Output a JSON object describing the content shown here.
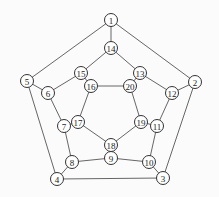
{
  "graph": {
    "nodes": [
      {
        "id": "1",
        "x": 111,
        "y": 20
      },
      {
        "id": "2",
        "x": 195,
        "y": 82
      },
      {
        "id": "3",
        "x": 163,
        "y": 178
      },
      {
        "id": "4",
        "x": 57,
        "y": 179
      },
      {
        "id": "5",
        "x": 27,
        "y": 81
      },
      {
        "id": "6",
        "x": 48,
        "y": 93
      },
      {
        "id": "7",
        "x": 64,
        "y": 126
      },
      {
        "id": "8",
        "x": 72,
        "y": 162
      },
      {
        "id": "9",
        "x": 111,
        "y": 158
      },
      {
        "id": "10",
        "x": 149,
        "y": 162
      },
      {
        "id": "11",
        "x": 157,
        "y": 126
      },
      {
        "id": "12",
        "x": 172,
        "y": 93
      },
      {
        "id": "13",
        "x": 140,
        "y": 73
      },
      {
        "id": "14",
        "x": 111,
        "y": 48
      },
      {
        "id": "15",
        "x": 81,
        "y": 73
      },
      {
        "id": "16",
        "x": 91,
        "y": 86
      },
      {
        "id": "17",
        "x": 78,
        "y": 122
      },
      {
        "id": "18",
        "x": 111,
        "y": 145
      },
      {
        "id": "19",
        "x": 141,
        "y": 122
      },
      {
        "id": "20",
        "x": 130,
        "y": 86
      }
    ],
    "edges": [
      [
        "1",
        "2"
      ],
      [
        "2",
        "3"
      ],
      [
        "3",
        "4"
      ],
      [
        "4",
        "5"
      ],
      [
        "5",
        "1"
      ],
      [
        "1",
        "14"
      ],
      [
        "2",
        "12"
      ],
      [
        "3",
        "10"
      ],
      [
        "4",
        "8"
      ],
      [
        "5",
        "6"
      ],
      [
        "6",
        "15"
      ],
      [
        "15",
        "14"
      ],
      [
        "14",
        "13"
      ],
      [
        "13",
        "12"
      ],
      [
        "12",
        "11"
      ],
      [
        "11",
        "10"
      ],
      [
        "10",
        "9"
      ],
      [
        "9",
        "8"
      ],
      [
        "8",
        "7"
      ],
      [
        "7",
        "6"
      ],
      [
        "15",
        "16"
      ],
      [
        "13",
        "20"
      ],
      [
        "11",
        "19"
      ],
      [
        "9",
        "18"
      ],
      [
        "7",
        "17"
      ],
      [
        "16",
        "20"
      ],
      [
        "20",
        "19"
      ],
      [
        "19",
        "18"
      ],
      [
        "18",
        "17"
      ],
      [
        "17",
        "16"
      ]
    ]
  }
}
